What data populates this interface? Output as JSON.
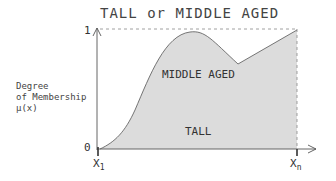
{
  "title": "TALL or MIDDLE AGED",
  "y_axis": {
    "label_lines": [
      "Degree",
      "of Membership",
      "μ(x)"
    ],
    "tick_top": "1",
    "tick_bottom": "0"
  },
  "x_axis": {
    "start_label": "X",
    "start_sub": "1",
    "end_label": "X",
    "end_sub": "n"
  },
  "regions": {
    "middle_aged": "MIDDLE AGED",
    "tall": "TALL"
  },
  "colors": {
    "fill": "#dcdcdc",
    "line": "#555555",
    "dashed": "#888888"
  }
}
